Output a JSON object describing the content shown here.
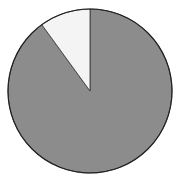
{
  "chart_data": {
    "type": "pie",
    "title": "",
    "categories": [
      "Slice A",
      "Slice B"
    ],
    "values": [
      90,
      10
    ],
    "colors": [
      "#8c8c8c",
      "#f4f4f4"
    ],
    "start_angle_deg": 0,
    "direction": "clockwise-from-12-oclock",
    "legend": "none",
    "outline_color": "#222222"
  }
}
